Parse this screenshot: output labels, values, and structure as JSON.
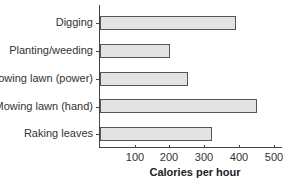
{
  "chart_data": {
    "type": "bar",
    "orientation": "horizontal",
    "title": "",
    "xlabel": "Calories per hour",
    "ylabel": "",
    "categories": [
      "Digging",
      "Planting/weeding",
      "Mowing lawn (power)",
      "Mowing lawn (hand)",
      "Raking leaves"
    ],
    "values": [
      390,
      200,
      250,
      450,
      320
    ],
    "xlim": [
      0,
      520
    ],
    "xticks": [
      100,
      200,
      300,
      400,
      500
    ],
    "grid": false,
    "legend": null,
    "bar_color": "#e3e3e3",
    "bar_edge_color": "#555555"
  }
}
